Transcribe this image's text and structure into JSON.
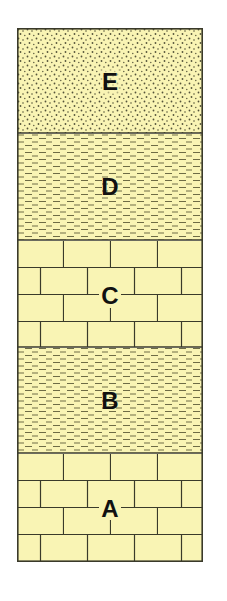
{
  "diagram": {
    "type": "stratigraphic-column",
    "colors": {
      "fill": "#f9f4b4",
      "line": "#3a3a2a",
      "dash": "#6e6c46",
      "dot": "#55543a",
      "label": "#111111"
    },
    "layers": [
      {
        "label": "E",
        "lithology": "sandstone",
        "pattern": "dots"
      },
      {
        "label": "D",
        "lithology": "shale",
        "pattern": "dashes"
      },
      {
        "label": "C",
        "lithology": "limestone",
        "pattern": "bricks"
      },
      {
        "label": "B",
        "lithology": "shale",
        "pattern": "dashes"
      },
      {
        "label": "A",
        "lithology": "limestone",
        "pattern": "bricks"
      }
    ]
  }
}
